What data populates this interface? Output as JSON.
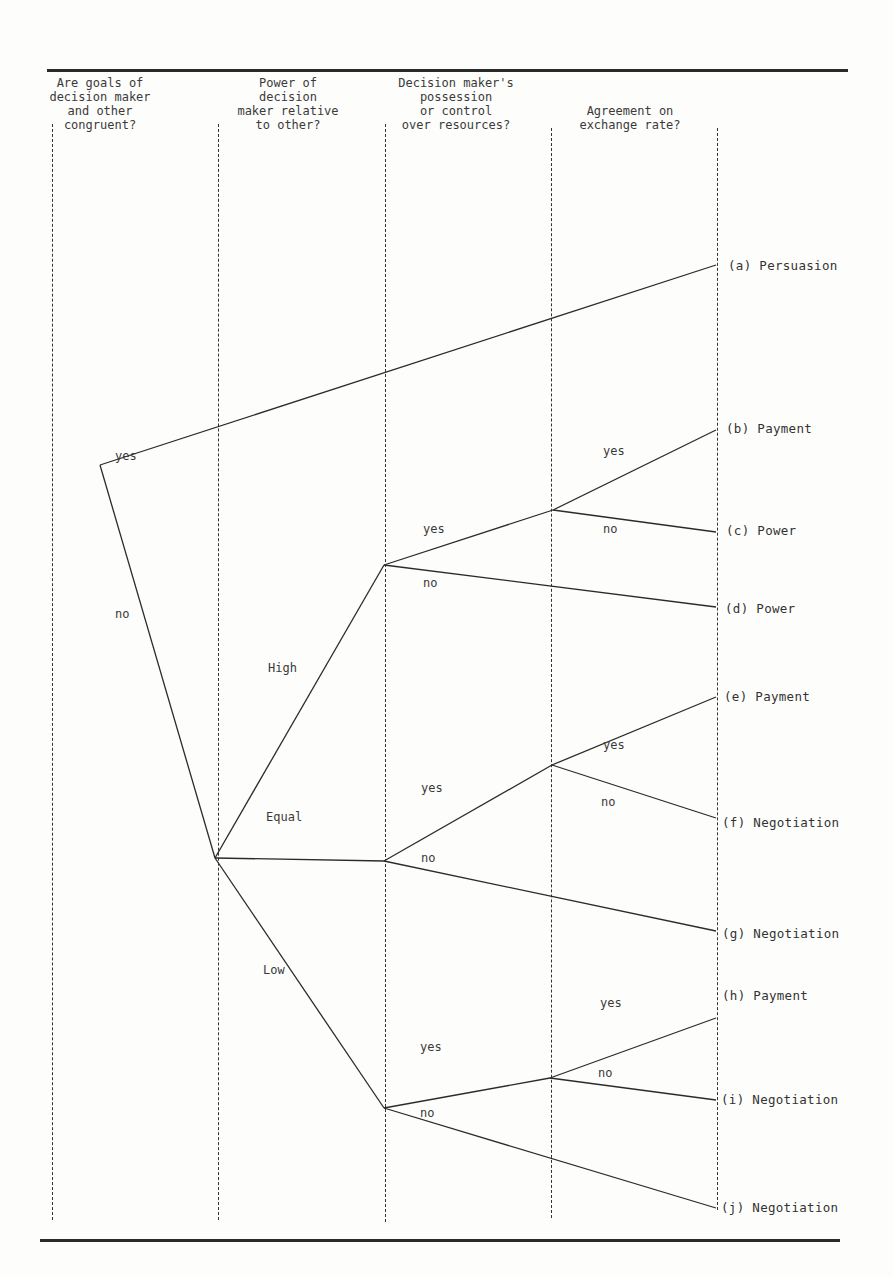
{
  "figure": {
    "type": "decision-tree",
    "columns": [
      {
        "id": "goals",
        "question": "Are goals of\ndecision maker\nand other\ncongruent?"
      },
      {
        "id": "power",
        "question": "Power of\ndecision\nmaker relative\nto other?"
      },
      {
        "id": "resources",
        "question": "Decision maker's\npossession\nor control\nover resources?"
      },
      {
        "id": "exchange",
        "question": "Agreement on\nexchange rate?"
      }
    ],
    "branch_labels": {
      "root_yes": "yes",
      "root_no": "no",
      "high": "High",
      "equal": "Equal",
      "low": "Low",
      "high_yes": "yes",
      "high_no": "no",
      "high_exch_yes": "yes",
      "high_exch_no": "no",
      "equal_yes": "yes",
      "equal_no": "no",
      "equal_exch_yes": "yes",
      "equal_exch_no": "no",
      "low_yes": "yes",
      "low_no": "no",
      "low_exch_yes": "yes",
      "low_exch_no": "no"
    },
    "outcomes": [
      {
        "id": "a",
        "label": "(a) Persuasion"
      },
      {
        "id": "b",
        "label": "(b) Payment"
      },
      {
        "id": "c",
        "label": "(c) Power"
      },
      {
        "id": "d",
        "label": "(d) Power"
      },
      {
        "id": "e",
        "label": "(e) Payment"
      },
      {
        "id": "f",
        "label": "(f) Negotiation"
      },
      {
        "id": "g",
        "label": "(g) Negotiation"
      },
      {
        "id": "h",
        "label": "(h) Payment"
      },
      {
        "id": "i",
        "label": "(i) Negotiation"
      },
      {
        "id": "j",
        "label": "(j) Negotiation"
      }
    ]
  }
}
